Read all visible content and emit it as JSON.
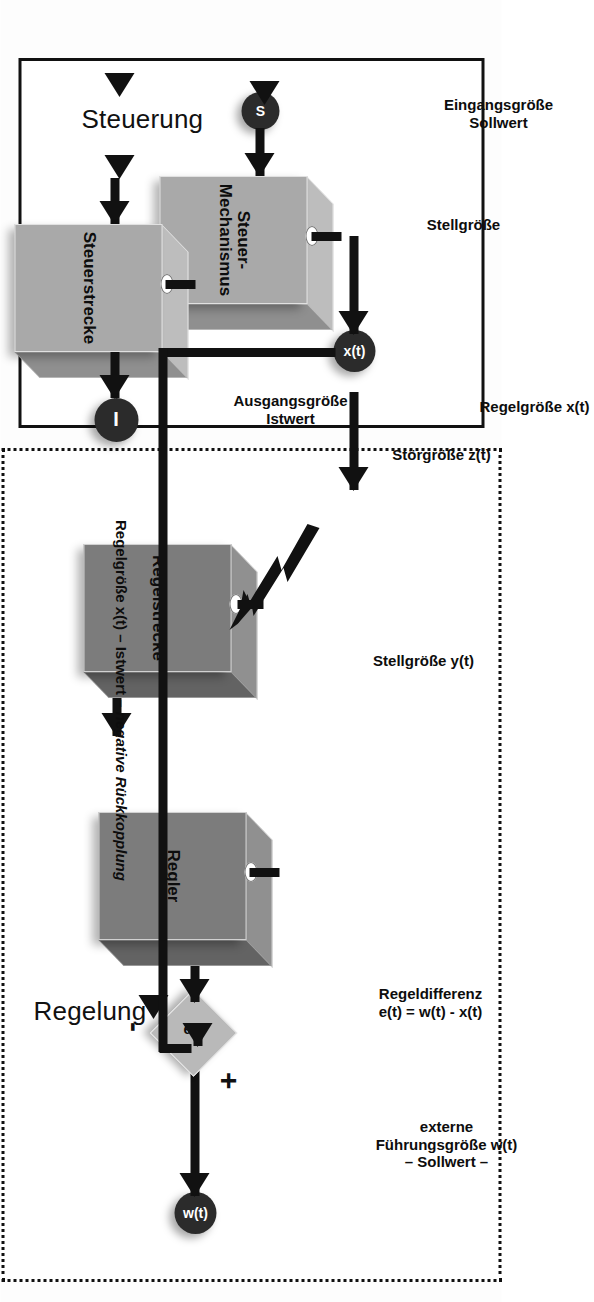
{
  "figure": {
    "kind": "control-theory-block-diagram",
    "language": "de",
    "orientation": "rotated-90-clockwise"
  },
  "steuerung": {
    "title": "Steuerung",
    "input_caption": "Eingangsgröße\nSollwert",
    "input_node": "S",
    "block1": "Steuer-\nMechanismus",
    "mid_caption": "Stellgröße",
    "block2": "Steuerstrecke",
    "output_caption": "Ausgangsgröße\nIstwert",
    "output_node": "I"
  },
  "regelung": {
    "title": "Regelung",
    "input_caption": "externe\nFührungsgröße w(t)\n– Sollwert –",
    "input_node": "w(t)",
    "sum_node": "e(t)",
    "sum_plus": "+",
    "sum_minus": "-",
    "error_caption": "Regeldifferenz\ne(t) = w(t) - x(t)",
    "block1": "Regler",
    "mid_caption": "Stellgröße y(t)",
    "block2": "Regelstrecke",
    "disturbance_caption": "Störgröße z(t)",
    "output_caption": "Regelgröße x(t)",
    "output_node": "x(t)",
    "feedback_caption_plain": "Regelgröße x(t) – Istwert – ",
    "feedback_caption_italic": "negative Rückkopplung"
  },
  "colors": {
    "ink": "#111111",
    "block_light_face": "#a9a9a9",
    "block_dark_face": "#7c7c7c",
    "node_fill": "#2b2b2b",
    "diamond_fill": "#b9b9b9",
    "page_background": "#ffffff"
  }
}
